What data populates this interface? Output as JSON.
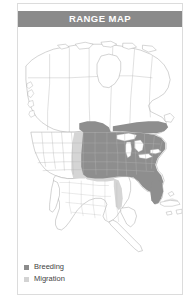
{
  "card": {
    "header_title": "RANGE MAP"
  },
  "legend": {
    "items": [
      {
        "label": "Breeding",
        "color": "#8c8c8c",
        "swatch_icon": "square-swatch"
      },
      {
        "label": "Migration",
        "color": "#d3d3d3",
        "swatch_icon": "square-swatch"
      }
    ]
  },
  "colors": {
    "header_band": "#8a8a8a",
    "header_text": "#ffffff",
    "card_border": "#dcdcdc",
    "land_fill": "#ffffff",
    "land_stroke": "#9a9a9a",
    "breeding_fill": "#8c8c8c",
    "migration_fill": "#d3d3d3",
    "water_fill": "#ffffff",
    "page_background": "#ffffff"
  },
  "map": {
    "region": "North America",
    "projection_note": "continental outline with political subdivisions",
    "layers": [
      {
        "name": "landmass",
        "fill": "#ffffff",
        "stroke": "#9a9a9a"
      },
      {
        "name": "political-boundaries",
        "stroke": "#b0b0b0"
      },
      {
        "name": "migration-range",
        "fill": "#d3d3d3"
      },
      {
        "name": "breeding-range",
        "fill": "#8c8c8c"
      },
      {
        "name": "great-lakes",
        "fill": "#ffffff"
      }
    ]
  }
}
